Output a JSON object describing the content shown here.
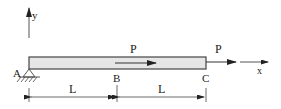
{
  "diagram": {
    "type": "structural-beam",
    "colors": {
      "line": "#333333",
      "beam_fill": "#e6e6e6",
      "beam_stroke": "#444444",
      "text": "#222222"
    },
    "axes": {
      "y_label": "y",
      "x_label": "x"
    },
    "points": {
      "A": "A",
      "B": "B",
      "C": "C"
    },
    "loads": {
      "internal_force_label": "P",
      "end_force_label": "P"
    },
    "dimensions": {
      "segment_AB": "L",
      "segment_BC": "L"
    }
  }
}
